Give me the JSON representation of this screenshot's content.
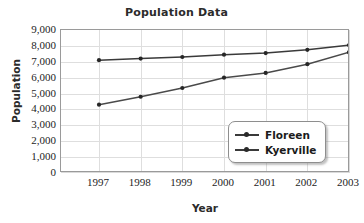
{
  "chart_data": {
    "type": "line",
    "title": "Population Data",
    "xlabel": "Year",
    "ylabel": "Population",
    "categories": [
      "1997",
      "1998",
      "1999",
      "2000",
      "2001",
      "2002",
      "2003"
    ],
    "x": [
      1997,
      1998,
      1999,
      2000,
      2001,
      2002,
      2003
    ],
    "series": [
      {
        "name": "Floreen",
        "values": [
          7100,
          7200,
          7300,
          7450,
          7550,
          7750,
          8050
        ],
        "color": "#3a3a3a"
      },
      {
        "name": "Kyerville",
        "values": [
          4300,
          4800,
          5350,
          6000,
          6300,
          6850,
          7600
        ],
        "color": "#4a4a4a"
      }
    ],
    "ylim": [
      0,
      9000
    ],
    "ytick_values": [
      0,
      1000,
      2000,
      3000,
      4000,
      5000,
      6000,
      7000,
      8000,
      9000
    ],
    "ytick_labels": [
      "0",
      "1,000",
      "2,000",
      "3,000",
      "4,000",
      "5,000",
      "6,000",
      "7,000",
      "8,000",
      "9,000"
    ],
    "grid": true,
    "legend_position": "bottom-right",
    "marker": "dot"
  },
  "legend": {
    "entries": [
      {
        "label": "Floreen"
      },
      {
        "label": "Kyerville"
      }
    ]
  }
}
